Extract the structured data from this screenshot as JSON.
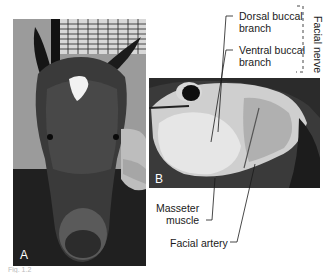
{
  "figure": {
    "panels": [
      {
        "id": "A",
        "letter": "A",
        "description": "Frontal view of a horse head with white star marking, handler's hands on cheek"
      },
      {
        "id": "B",
        "letter": "B",
        "description": "Dissected lateral view of horse face showing masseter region"
      }
    ],
    "labels": {
      "dorsal_line1": "Dorsal buccal",
      "dorsal_line2": "branch",
      "ventral_line1": "Ventral buccal",
      "ventral_line2": "branch",
      "facial_nerve": "Facial nerve",
      "masseter_line1": "Masseter",
      "masseter_line2": "muscle",
      "facial_artery": "Facial artery"
    },
    "caption": "Fig. 1.2"
  }
}
